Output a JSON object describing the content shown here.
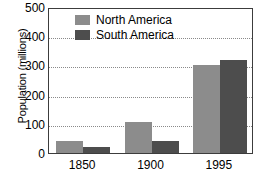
{
  "chart_data": {
    "type": "bar",
    "title": "",
    "xlabel": "",
    "ylabel": "Population (millions)",
    "categories": [
      "1850",
      "1900",
      "1995"
    ],
    "series": [
      {
        "name": "North America",
        "values": [
          40,
          105,
          300
        ],
        "color": "#8c8c8c"
      },
      {
        "name": "South America",
        "values": [
          20,
          40,
          318
        ],
        "color": "#4d4d4d"
      }
    ],
    "ylim": [
      0,
      500
    ],
    "yticks": [
      0,
      100,
      200,
      300,
      400,
      500
    ],
    "ytick_labels": [
      "0",
      "100",
      "200",
      "300",
      "400",
      "500"
    ],
    "grid": true,
    "grid_style": "dotted",
    "grid_color": "#8a8a8a",
    "legend_position": "top-left-inside",
    "frame_color": "#3c3c3c",
    "background": "#ffffff"
  }
}
